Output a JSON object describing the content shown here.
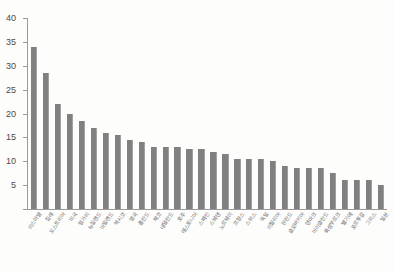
{
  "chart_data": {
    "type": "bar",
    "title": "",
    "subtitle": "",
    "xlabel": "",
    "ylabel": "",
    "ylim": [
      0,
      40
    ],
    "yticks": [
      0,
      5,
      10,
      15,
      20,
      25,
      30,
      35,
      40
    ],
    "ytick_labels": [
      "",
      "5",
      "10",
      "15",
      "20",
      "25",
      "30",
      "35",
      "40"
    ],
    "grid": false,
    "legend": "none",
    "bar_color": "#808080",
    "axis_color": "#9a9a9a",
    "background_color": "#fdfdfc",
    "categories": [
      "이스라엘",
      "칠레",
      "오스트리아",
      "미국",
      "헝가리",
      "뉴질랜드",
      "아일랜드",
      "멕시코",
      "영국",
      "폴란드",
      "체코",
      "네덜란드",
      "호주",
      "에스토니아",
      "스페인",
      "스웨덴",
      "노르웨이",
      "프랑스",
      "스위스",
      "독일",
      "이탈리아",
      "핀란드",
      "슬로바키아",
      "덴마크",
      "아이슬란드",
      "룩셈부르크",
      "벨기에",
      "포르투갈",
      "그리스",
      "일본"
    ],
    "values": [
      34.0,
      28.5,
      22.0,
      20.0,
      18.5,
      17.0,
      16.0,
      15.5,
      14.5,
      14.0,
      13.0,
      13.0,
      13.0,
      12.5,
      12.5,
      12.0,
      11.5,
      10.5,
      10.5,
      10.5,
      10.0,
      9.0,
      8.5,
      8.5,
      8.5,
      7.5,
      6.0,
      6.0,
      6.0,
      5.0
    ]
  }
}
